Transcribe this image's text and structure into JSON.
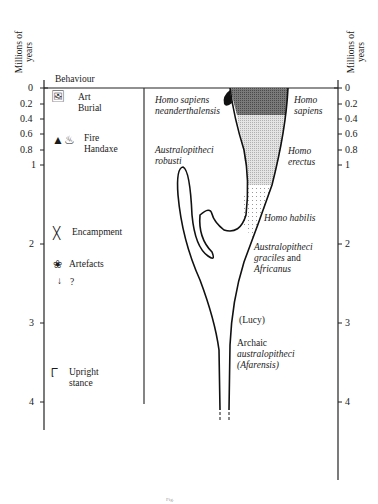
{
  "axis": {
    "title_line1": "Millions of",
    "title_line2": "years",
    "ticks": [
      {
        "label": "0",
        "value": 0,
        "y": 88
      },
      {
        "label": "0.2",
        "value": 0.2,
        "y": 104
      },
      {
        "label": "0.4",
        "value": 0.4,
        "y": 119
      },
      {
        "label": "0.6",
        "value": 0.6,
        "y": 134
      },
      {
        "label": "0.8",
        "value": 0.8,
        "y": 150
      },
      {
        "label": "1",
        "value": 1,
        "y": 165
      },
      {
        "label": "2",
        "value": 2,
        "y": 244
      },
      {
        "label": "3",
        "value": 3,
        "y": 323
      },
      {
        "label": "4",
        "value": 4,
        "y": 402
      }
    ]
  },
  "behaviour": {
    "header": "Behaviour",
    "items": [
      {
        "icon": "art-burial-icon",
        "line1": "Art",
        "line2": "Burial"
      },
      {
        "icon": "fire-handaxe-icon",
        "line1": "Fire",
        "line2": "Handaxe"
      },
      {
        "icon": "encampment-icon",
        "line1": "Encampment",
        "line2": ""
      },
      {
        "icon": "artefacts-icon",
        "line1": "Artefacts",
        "line2": ""
      },
      {
        "icon": "arrow-down-icon",
        "line1": "?",
        "line2": ""
      },
      {
        "icon": "footprint-icon",
        "line1": "Upright",
        "line2": "stance"
      }
    ]
  },
  "species": {
    "neanderthal": {
      "line1": "Homo sapiens",
      "line2": "neanderthalensis"
    },
    "sapiens": {
      "line1": "Homo",
      "line2": "sapiens"
    },
    "robusti": {
      "line1": "Australopitheci",
      "line2": "robusti"
    },
    "erectus": {
      "line1": "Homo",
      "line2": "erectus"
    },
    "habilis": {
      "line1": "Homo habilis"
    },
    "graciles": {
      "line1": "Australopitheci",
      "line2a": "graciles",
      "line2b": " and",
      "line3": "Africanus"
    },
    "lucy": {
      "line1": "(Lucy)"
    },
    "afarensis": {
      "line1": "Archaic",
      "line2": "australopitheci",
      "line3": "(Afarensis)"
    }
  },
  "caption": "Fig."
}
